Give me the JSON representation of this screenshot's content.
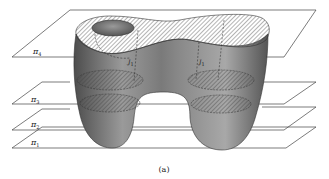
{
  "figure": {
    "caption": "(a)",
    "planes": [
      {
        "id": "pi4",
        "label": "π",
        "subscript": "4"
      },
      {
        "id": "pi3",
        "label": "π",
        "subscript": "3"
      },
      {
        "id": "pi2",
        "label": "π",
        "subscript": "2"
      },
      {
        "id": "pi1",
        "label": "π",
        "subscript": "1"
      }
    ],
    "curve_labels": [
      {
        "id": "J1-left",
        "label": "J",
        "subscript": "1"
      },
      {
        "id": "J1-right",
        "label": "J",
        "subscript": "1"
      }
    ],
    "colors": {
      "surface_dark": "#5a5a5a",
      "surface_light": "#c8c8c8",
      "line": "#333333",
      "background": "#ffffff"
    }
  }
}
